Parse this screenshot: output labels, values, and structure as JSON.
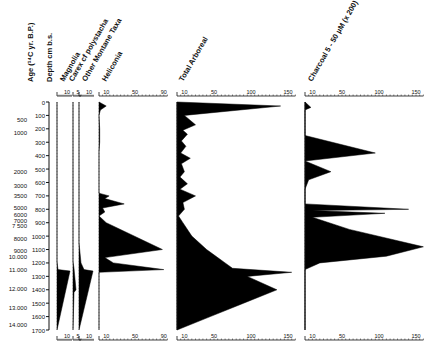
{
  "chart_data": {
    "type": "area",
    "title": "",
    "orientation": "vertical-stratigraphic",
    "y_axes": {
      "age": {
        "label": "Age (14C yr. B.P.)",
        "label_display": "Age (¹⁴C yr. B.P.)",
        "ticks": [
          {
            "label": "500",
            "depth": 130
          },
          {
            "label": "1000",
            "depth": 230
          },
          {
            "label": "2000",
            "depth": 520
          },
          {
            "label": "3000",
            "depth": 620
          },
          {
            "label": "3500",
            "depth": 700
          },
          {
            "label": "5000",
            "depth": 790
          },
          {
            "label": "6000",
            "depth": 840
          },
          {
            "label": "7000",
            "depth": 880
          },
          {
            "label": "7 500",
            "depth": 920
          },
          {
            "label": "8000",
            "depth": 1020
          },
          {
            "label": "9000",
            "depth": 1110
          },
          {
            "label": "10.000",
            "depth": 1150
          },
          {
            "label": "11.000",
            "depth": 1250
          },
          {
            "label": "12.000",
            "depth": 1390
          },
          {
            "label": "13.000",
            "depth": 1530
          },
          {
            "label": "14.000",
            "depth": 1660
          }
        ]
      },
      "depth": {
        "label": "Depth cm b.s.",
        "ylim": [
          0,
          1700
        ],
        "ticks": [
          0,
          100,
          200,
          300,
          400,
          500,
          600,
          700,
          800,
          900,
          1000,
          1100,
          1200,
          1300,
          1400,
          1500,
          1600,
          1700
        ]
      }
    },
    "panels": [
      {
        "name": "Magnolia",
        "xticks": [
          "10"
        ],
        "xlim": [
          0,
          15
        ],
        "depth": [
          0,
          1190,
          1250,
          1260,
          1700
        ],
        "values": [
          0,
          0,
          1,
          13,
          0
        ]
      },
      {
        "name": "Carex cf polystacha",
        "xticks": [
          "5"
        ],
        "xlim": [
          0,
          8
        ],
        "depth": [
          0,
          1190,
          1240,
          1400,
          1420,
          1700
        ],
        "values": [
          0,
          0,
          1,
          3,
          1,
          0
        ]
      },
      {
        "name": "Other Montane Taxa",
        "xticks": [
          "10"
        ],
        "xlim": [
          0,
          15
        ],
        "depth": [
          0,
          1050,
          1200,
          1250,
          1260,
          1700
        ],
        "values": [
          0,
          0,
          2,
          5,
          14,
          0
        ]
      },
      {
        "name": "Heliconia",
        "xticks": [
          "10",
          "50",
          "90"
        ],
        "xlim": [
          0,
          95
        ],
        "depth": [
          0,
          30,
          60,
          100,
          200,
          300,
          370,
          420,
          550,
          680,
          700,
          720,
          760,
          790,
          820,
          850,
          900,
          1100,
          1160,
          1200,
          1250,
          1270,
          1700
        ],
        "values": [
          0,
          10,
          2,
          0,
          1,
          1,
          0,
          0,
          0,
          0,
          14,
          8,
          35,
          5,
          8,
          0,
          10,
          88,
          8,
          20,
          90,
          0,
          0
        ]
      },
      {
        "name": "Total Arboreal",
        "xticks": [
          "10",
          "50",
          "100",
          "150"
        ],
        "xlim": [
          0,
          160
        ],
        "depth": [
          0,
          30,
          100,
          170,
          210,
          240,
          290,
          330,
          380,
          420,
          460,
          520,
          560,
          610,
          650,
          700,
          750,
          800,
          850,
          900,
          1000,
          1100,
          1160,
          1200,
          1240,
          1270,
          1300,
          1400,
          1500,
          1600,
          1700
        ],
        "values": [
          0,
          140,
          10,
          25,
          8,
          14,
          6,
          12,
          5,
          18,
          6,
          10,
          4,
          14,
          4,
          25,
          8,
          10,
          2,
          8,
          20,
          40,
          55,
          65,
          75,
          155,
          95,
          135,
          90,
          45,
          0
        ]
      },
      {
        "name": "Charcoal 5 - 50 µM (x 200)",
        "xticks": [
          "10",
          "50",
          "100",
          "150"
        ],
        "xlim": [
          0,
          160
        ],
        "depth": [
          0,
          40,
          60,
          120,
          250,
          380,
          440,
          520,
          580,
          650,
          760,
          800,
          810,
          830,
          860,
          950,
          1080,
          1150,
          1200,
          1250,
          1700
        ],
        "values": [
          0,
          8,
          0,
          0,
          0,
          95,
          0,
          35,
          5,
          0,
          0,
          140,
          10,
          108,
          10,
          60,
          160,
          110,
          20,
          0,
          0
        ]
      }
    ]
  },
  "labels": {
    "age_axis": "Age (¹⁴C yr. B.P.)",
    "depth_axis": "Depth cm b.s.",
    "magnolia": "Magnolia",
    "carex": "Carex cf polystacha",
    "montane": "Other Montane Taxa",
    "heliconia": "Heliconia",
    "arboreal": "Total Arboreal",
    "charcoal": "Charcoal 5 - 50 µM (x 200)"
  }
}
